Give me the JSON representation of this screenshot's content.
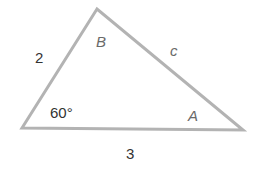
{
  "diagram": {
    "type": "triangle",
    "stroke_color": "#b3b3b3",
    "vertices": {
      "B": {
        "x": 97,
        "y": 9
      },
      "C": {
        "x": 22,
        "y": 128
      },
      "A": {
        "x": 243,
        "y": 130
      }
    },
    "labels": {
      "side_a": "2",
      "side_b": "3",
      "side_c": "c",
      "vertex_B": "B",
      "vertex_A": "A",
      "angle_C": "60°"
    }
  }
}
